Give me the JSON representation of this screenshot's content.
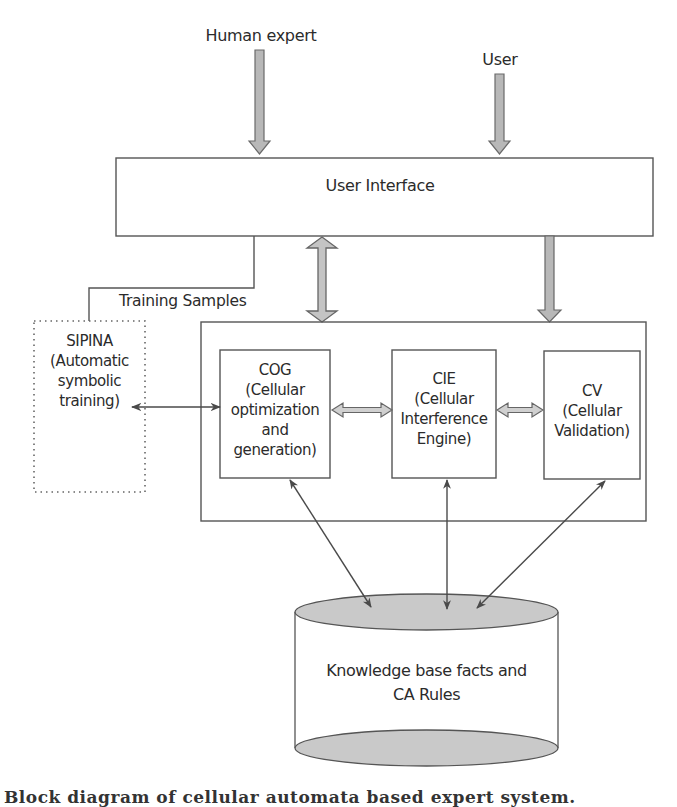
{
  "diagram": {
    "inputs": {
      "human_expert": "Human expert",
      "user": "User"
    },
    "user_interface": {
      "label": "User Interface"
    },
    "training_link": {
      "label": "Training Samples"
    },
    "sipina": {
      "lines": [
        "SIPINA",
        "(Automatic",
        "symbolic",
        "training)"
      ]
    },
    "modules": [
      {
        "id": "cog",
        "lines": [
          "COG",
          "(Cellular",
          "optimization",
          "and",
          "generation)"
        ]
      },
      {
        "id": "cie",
        "lines": [
          "CIE",
          "(Cellular",
          "Interference",
          "Engine)"
        ]
      },
      {
        "id": "cv",
        "lines": [
          "CV",
          "(Cellular",
          "Validation)"
        ]
      }
    ],
    "knowledge_base": {
      "lines": [
        "Knowledge base facts and",
        "CA Rules"
      ]
    },
    "caption": "Block diagram of cellular automata based expert system.",
    "colors": {
      "line": "#555555",
      "arrow_fill": "#b8b8b8",
      "cylinder_fill": "#c9c9c9",
      "text": "#2b2b2b"
    }
  }
}
